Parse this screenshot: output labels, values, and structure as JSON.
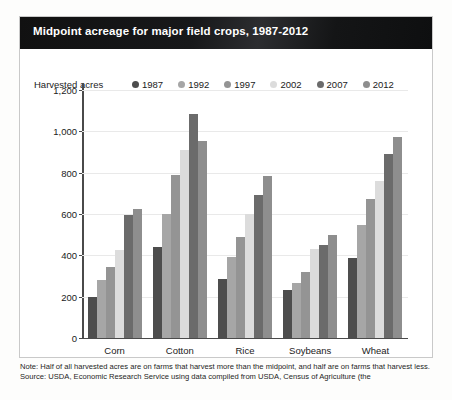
{
  "card": {
    "title": "Midpoint acreage for major field crops, 1987-2012",
    "y_axis_caption": "Harvested acres"
  },
  "footer": {
    "note": "Note: Half of all harvested acres are on farms that harvest more than the midpoint, and half are on farms that harvest less.",
    "source": "Source: USDA, Economic Research Service using data compiled from USDA, Census of Agriculture (the"
  },
  "colors": {
    "title_bar": "#111111",
    "axis": "#4a4a4a",
    "grid": "#e9e9e9",
    "series": [
      "#4d4d4d",
      "#a6a6a6",
      "#949494",
      "#dcdcdc",
      "#6b6b6b",
      "#8e8e8e"
    ]
  },
  "chart_data": {
    "type": "bar",
    "title": "Midpoint acreage for major field crops, 1987-2012",
    "xlabel": "",
    "ylabel": "Harvested acres",
    "ylim": [
      0,
      1200
    ],
    "yticks": [
      0,
      200,
      400,
      600,
      800,
      1000,
      1200
    ],
    "ytick_labels": [
      "0",
      "200",
      "400",
      "600",
      "800",
      "1,000",
      "1,200"
    ],
    "grid": true,
    "legend_position": "top",
    "categories": [
      "Corn",
      "Cotton",
      "Rice",
      "Soybeans",
      "Wheat"
    ],
    "series": [
      {
        "name": "1987",
        "color": "#4d4d4d",
        "values": [
          200,
          440,
          285,
          230,
          385
        ]
      },
      {
        "name": "1992",
        "color": "#a6a6a6",
        "values": [
          280,
          600,
          390,
          265,
          545
        ]
      },
      {
        "name": "1997",
        "color": "#949494",
        "values": [
          345,
          790,
          490,
          320,
          675
        ]
      },
      {
        "name": "2002",
        "color": "#dcdcdc",
        "values": [
          425,
          910,
          600,
          430,
          760
        ]
      },
      {
        "name": "2007",
        "color": "#6b6b6b",
        "values": [
          595,
          1085,
          690,
          450,
          890
        ]
      },
      {
        "name": "2012",
        "color": "#8e8e8e",
        "values": [
          625,
          955,
          785,
          500,
          975
        ]
      }
    ]
  }
}
